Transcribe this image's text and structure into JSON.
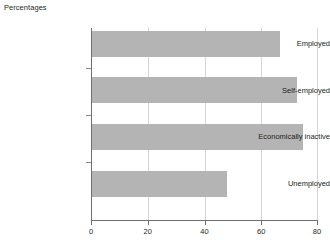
{
  "chart_data": {
    "type": "bar",
    "orientation": "horizontal",
    "title": "Percentages",
    "xlabel": "",
    "ylabel": "",
    "categories": [
      "Employed",
      "Self-employed",
      "Economically inactive",
      "Unemployed"
    ],
    "values": [
      67,
      73,
      75,
      48
    ],
    "xlim": [
      0,
      80
    ],
    "xticks": [
      "0",
      "20",
      "40",
      "60",
      "80"
    ],
    "xtick_values": [
      0,
      20,
      40,
      60,
      80
    ],
    "grid": true,
    "legend": false,
    "bar_color": "#b4b4b4",
    "axis_color": "#6f6f6f",
    "grid_color": "#d4d4d4",
    "text_color": "#231f20",
    "background": "#ffffff"
  }
}
